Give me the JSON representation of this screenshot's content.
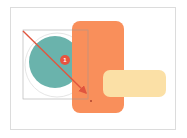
{
  "canvas": {
    "background": "#ffffff",
    "border_color": "#dcdcdc"
  },
  "shapes": {
    "halo_circle": {
      "cx": 57,
      "cy": 65,
      "r": 32,
      "fill": "#ffffff",
      "stroke": "#e6e6e6"
    },
    "teal_circle": {
      "cx": 55,
      "cy": 62,
      "r": 26,
      "fill": "#6ab3ac"
    },
    "orange_rect": {
      "x": 72,
      "y": 21,
      "width": 52,
      "height": 92,
      "rx": 8,
      "fill": "#f98f5b"
    },
    "yellow_rect": {
      "x": 103,
      "y": 70,
      "width": 63,
      "height": 27,
      "rx": 7,
      "fill": "#fbe0a6"
    },
    "selection_box": {
      "x": 23,
      "y": 30,
      "width": 65,
      "height": 69,
      "stroke": "#9a9a9a"
    }
  },
  "annotations": {
    "arrow": {
      "x1": 23,
      "y1": 31,
      "x2": 88,
      "y2": 95,
      "color": "#e0553e"
    },
    "badge": {
      "cx": 65,
      "cy": 60,
      "r": 5,
      "fill": "#e8533f",
      "label": "1"
    },
    "handle_dot": {
      "cx": 91,
      "cy": 101,
      "r": 1,
      "fill": "#b0442e"
    }
  }
}
